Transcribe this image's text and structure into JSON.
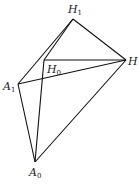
{
  "diagram": {
    "points": {
      "H1": {
        "x": 73,
        "y": 19,
        "label": "H",
        "sub": "1"
      },
      "H": {
        "x": 126,
        "y": 60,
        "label": "H",
        "sub": ""
      },
      "H0": {
        "x": 44,
        "y": 60,
        "label": "H",
        "sub": "0"
      },
      "A1": {
        "x": 18,
        "y": 84,
        "label": "A",
        "sub": "1"
      },
      "A0": {
        "x": 35,
        "y": 162,
        "label": "A",
        "sub": "0"
      }
    },
    "edges": [
      [
        "H1",
        "H"
      ],
      [
        "H1",
        "A1"
      ],
      [
        "H1",
        "H0"
      ],
      [
        "H0",
        "H"
      ],
      [
        "A1",
        "H"
      ],
      [
        "A1",
        "A0"
      ],
      [
        "H0",
        "A0"
      ],
      [
        "A0",
        "H"
      ]
    ]
  }
}
